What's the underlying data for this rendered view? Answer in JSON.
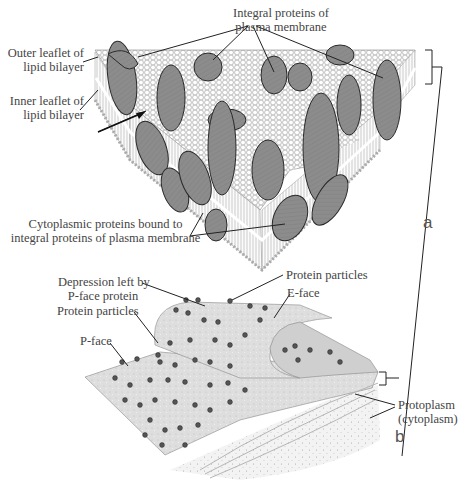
{
  "figure": {
    "type": "diagram",
    "panels": [
      {
        "id": "a",
        "label": "a"
      },
      {
        "id": "b",
        "label": "b"
      }
    ]
  },
  "labels": {
    "integral_proteins_l1": "Integral proteins of",
    "integral_proteins_l2": "plasma membrane",
    "outer_leaflet_l1": "Outer leaflet of",
    "outer_leaflet_l2": "lipid bilayer",
    "inner_leaflet_l1": "Inner leaflet of",
    "inner_leaflet_l2": "lipid bilayer",
    "cytoplasmic_l1": "Cytoplasmic proteins bound to",
    "cytoplasmic_l2": "integral proteins of plasma membrane",
    "depression_l1": "Depression left by",
    "depression_l2": "P-face protein",
    "protein_particles_top": "Protein particles",
    "e_face": "E-face",
    "protein_particles_left": "Protein particles",
    "p_face": "P-face",
    "protoplasm_l1": "Protoplasm",
    "protoplasm_l2": "(cytoplasm)"
  },
  "colors": {
    "protein_fill": "#8a8a8a",
    "protein_stroke": "#2a2a2a",
    "lipid_head": "#f4f4f4",
    "lipid_tail": "#d8d8d8",
    "fracture_face": "#e2e2e2",
    "line": "#222222"
  }
}
